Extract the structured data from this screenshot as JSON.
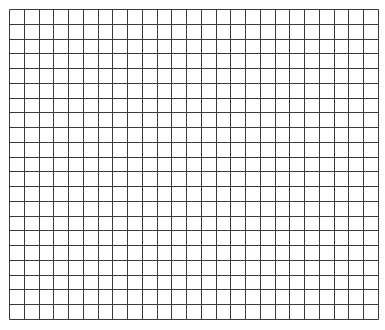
{
  "grid": {
    "columns": 25,
    "rows": 21,
    "origin_x": 9,
    "origin_y": 9,
    "width": 369,
    "height": 310,
    "line_color": "#3a3a3a",
    "background_color": "#ffffff",
    "cells_filled": []
  }
}
